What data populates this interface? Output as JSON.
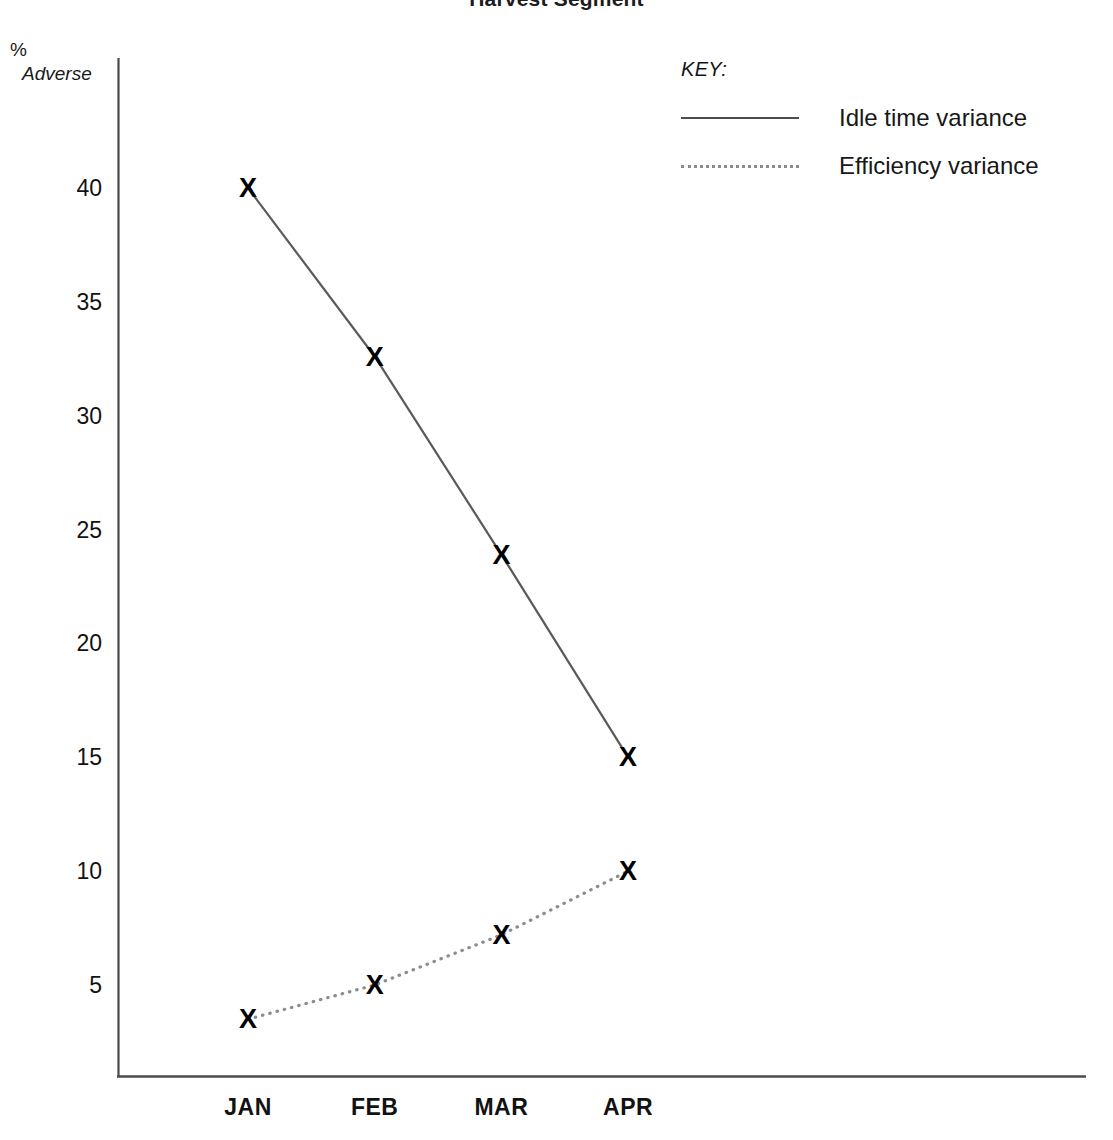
{
  "chart_data": {
    "type": "line",
    "title": "Harvest Segment",
    "xlabel": "",
    "ylabel": "% Adverse",
    "ylabel_line1": "%",
    "ylabel_line2": "Adverse",
    "categories": [
      "JAN",
      "FEB",
      "MAR",
      "APR"
    ],
    "yticks": [
      5,
      10,
      15,
      20,
      25,
      30,
      35,
      40
    ],
    "ytick_labels": [
      "5",
      "10",
      "15",
      "20",
      "25",
      "30",
      "35",
      "40"
    ],
    "ylim": [
      0,
      43
    ],
    "grid": false,
    "legend_position": "top-right",
    "legend_title": "KEY:",
    "series": [
      {
        "name": "Idle time variance",
        "style": "solid",
        "color": "#4d4d4d",
        "marker": "X",
        "values": [
          40,
          32.6,
          23.9,
          15
        ]
      },
      {
        "name": "Efficiency variance",
        "style": "dotted",
        "color": "#8a8a8a",
        "marker": "X",
        "values": [
          3.5,
          5,
          7.2,
          10
        ]
      }
    ]
  },
  "axes": {
    "x_axis_color": "#4a4a4a",
    "y_axis_color": "#4a4a4a"
  }
}
